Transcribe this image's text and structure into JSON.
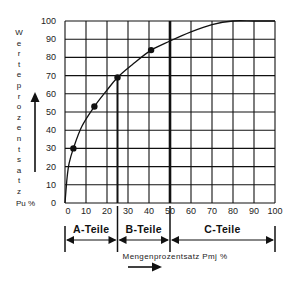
{
  "chart_data": {
    "type": "line",
    "title": "",
    "xlabel": "Mengenprozentsatz Pmj %",
    "ylabel": "Werteprozentsatz Pu %",
    "ylabel_letters": [
      "W",
      "e",
      "r",
      "t",
      "e",
      "p",
      "r",
      "o",
      "z",
      "e",
      "n",
      "t",
      "s",
      "a",
      "t",
      "z"
    ],
    "ylabel_unit": "Pu %",
    "xlim": [
      0,
      100
    ],
    "ylim": [
      0,
      100
    ],
    "x_ticks": [
      "0",
      "10",
      "20",
      "30",
      "40",
      "50",
      "60",
      "70",
      "80",
      "90",
      "100"
    ],
    "y_ticks": [
      "0",
      "10",
      "20",
      "30",
      "40",
      "50",
      "60",
      "70",
      "80",
      "90",
      "100"
    ],
    "grid": true,
    "curve": {
      "name": "Lorenzkurve",
      "x": [
        0,
        1,
        2,
        4,
        8,
        14,
        20,
        25,
        32,
        41,
        50,
        60,
        70,
        80,
        90,
        100
      ],
      "y": [
        0,
        14,
        22,
        30,
        42,
        53,
        62,
        69,
        76,
        84,
        89,
        94,
        98,
        100,
        100,
        100
      ]
    },
    "markers": {
      "x": [
        4,
        14,
        25,
        41
      ],
      "y": [
        30,
        53,
        69,
        84
      ]
    },
    "dividers": [
      {
        "x": 25,
        "y_top": 69,
        "label": "A/B boundary"
      },
      {
        "x": 50,
        "y_top": 100,
        "label": "B/C boundary",
        "bold": true
      }
    ],
    "segments": [
      {
        "label": "A-Teile",
        "from": 0,
        "to": 25
      },
      {
        "label": "B-Teile",
        "from": 25,
        "to": 50
      },
      {
        "label": "C-Teile",
        "from": 50,
        "to": 100
      }
    ]
  },
  "colors": {
    "line": "#111111",
    "grid": "#111111",
    "text": "#222222"
  }
}
